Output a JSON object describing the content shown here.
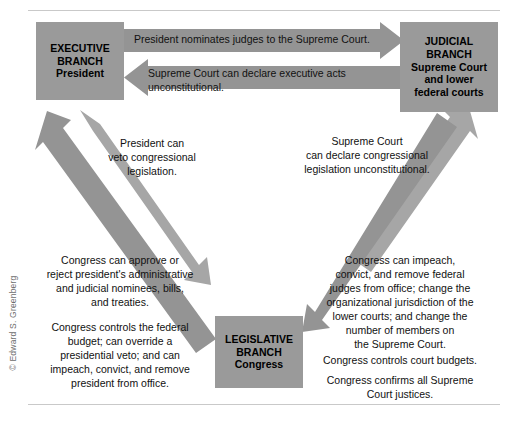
{
  "figure": {
    "credit": "© Edward S. Greenberg"
  },
  "boxes": {
    "executive": {
      "line1": "EXECUTIVE",
      "line2": "BRANCH",
      "line3": "President"
    },
    "judicial": {
      "line1": "JUDICIAL",
      "line2": "BRANCH",
      "line3": "Supreme Court",
      "line4": "and lower",
      "line5": "federal courts"
    },
    "legislative": {
      "line1": "LEGISLATIVE",
      "line2": "BRANCH",
      "line3": "Congress"
    }
  },
  "arrow_labels": {
    "nominates": "President nominates judges to the Supreme Court.",
    "declare_executive_acts": "Supreme Court can declare executive acts unconstitutional."
  },
  "notes": {
    "veto": "President can\nveto congressional\nlegislation.",
    "declare_congressional": "Supreme Court\ncan declare congressional\nlegislation unconstitutional.",
    "congress_approve": "Congress can approve or\nreject president's administrative\nand judicial nominees, bills,\nand treaties.",
    "congress_budget": "Congress controls the federal\nbudget; can override a\npresidential veto; and can\nimpeach, convict, and remove\npresident from office.",
    "congress_impeach": "Congress can impeach,\nconvict, and remove federal\njudges from office; change the\norganizational jurisdiction of the\nlower courts; and change the\nnumber of members on\nthe Supreme Court.",
    "court_budgets": "Congress controls court budgets.",
    "confirms_justices": "Congress confirms all Supreme\nCourt justices."
  },
  "colors": {
    "box_fill": "#9a9a9a",
    "arrow_fill": "#949494",
    "arrow_fill_light": "#a6a6a6",
    "rule": "#c9c9c9",
    "text": "#111111"
  }
}
